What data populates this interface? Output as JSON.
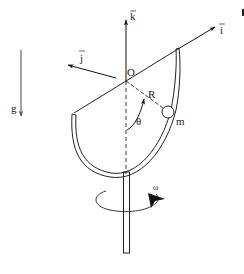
{
  "diagram": {
    "labels": {
      "k_vector": "k",
      "i_vector": "i",
      "j_vector": "j",
      "origin": "O",
      "radius": "R",
      "angle": "θ",
      "mass": "m",
      "gravity": "g",
      "angular_velocity": "ω"
    },
    "colors": {
      "stroke": "#222222",
      "gravity_arrow": "#555555",
      "background": "#ffffff"
    }
  }
}
